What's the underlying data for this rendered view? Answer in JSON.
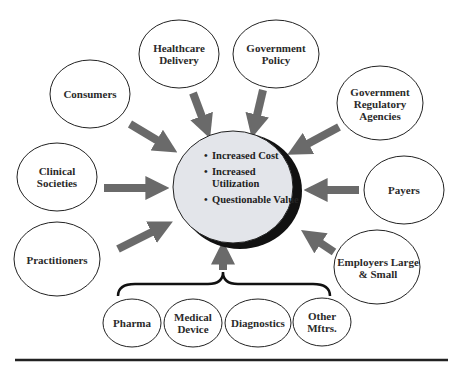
{
  "center": {
    "items": [
      "Increased Cost",
      "Increased Utilization",
      "Questionable Value"
    ]
  },
  "nodes": {
    "consumers": "Consumers",
    "healthcare_delivery": "Healthcare Delivery",
    "government_policy": "Government Policy",
    "government_regulatory": "Government Regulatory Agencies",
    "clinical_societies": "Clinical Societies",
    "payers": "Payers",
    "practitioners": "Practitioners",
    "employers": "Employers Large & Small"
  },
  "manufacturers": [
    "Pharma",
    "Medical Device",
    "Diagnostics",
    "Other Mftrs."
  ],
  "colors": {
    "arrow": "#6a6a6a",
    "center_fill": "#e3e5ea",
    "node_fill": "#ffffff",
    "outline": "#222222"
  }
}
